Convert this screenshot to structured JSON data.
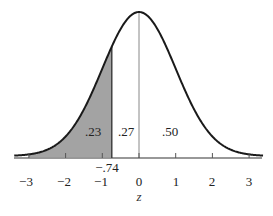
{
  "figure": {
    "area_labels": {
      "left_tail": ".23",
      "middle": ".27",
      "right_half": ".50"
    },
    "marker_label": "−.74",
    "x_axis": {
      "label": "z",
      "ticks": [
        "−3",
        "−2",
        "−1",
        "0",
        "1",
        "2",
        "3"
      ]
    },
    "colors": {
      "curve": "#1a1a1a",
      "shade": "#a3a3a3",
      "axis": "#333333",
      "center_line": "#888888"
    }
  },
  "chart_data": {
    "type": "area",
    "title": "",
    "xlabel": "z",
    "ylabel": "",
    "xlim": [
      -3.4,
      3.4
    ],
    "distribution": "standard normal",
    "shaded_region": {
      "from": "-inf",
      "to": -0.74,
      "area": 0.23
    },
    "regions": [
      {
        "range": [
          -99,
          -0.74
        ],
        "area": 0.23,
        "label": ".23",
        "shaded": true
      },
      {
        "range": [
          -0.74,
          0
        ],
        "area": 0.27,
        "label": ".27",
        "shaded": false
      },
      {
        "range": [
          0,
          99
        ],
        "area": 0.5,
        "label": ".50",
        "shaded": false
      }
    ],
    "annotations": [
      {
        "x": -0.74,
        "text": "−.74"
      }
    ],
    "x_ticks": [
      -3,
      -2,
      -1,
      0,
      1,
      2,
      3
    ],
    "grid": false
  }
}
